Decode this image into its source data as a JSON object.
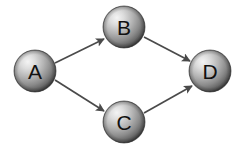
{
  "figure": {
    "title": "",
    "background_color": "#ffffff",
    "width": 241,
    "height": 148
  },
  "diagram": {
    "type": "directed-graph",
    "style": "3d-shaded-sphere-nodes",
    "node_colors": {
      "highlight": "#f2f2f2",
      "midtone": "#a8a8a8",
      "shadow": "#3a3a3a",
      "outline": "#555555",
      "label": "#111111"
    },
    "edge_color": "#4a4a4a",
    "nodes": [
      {
        "id": "A",
        "label": "A",
        "cx": 35,
        "cy": 71,
        "r": 21
      },
      {
        "id": "B",
        "label": "B",
        "cx": 124,
        "cy": 27,
        "r": 21
      },
      {
        "id": "C",
        "label": "C",
        "cx": 124,
        "cy": 122,
        "r": 21
      },
      {
        "id": "D",
        "label": "D",
        "cx": 210,
        "cy": 71,
        "r": 21
      }
    ],
    "edges": [
      {
        "id": "A-B",
        "from": "A",
        "to": "B",
        "label": "",
        "directed": true,
        "x1": 55,
        "y1": 63,
        "x2": 104,
        "y2": 39
      },
      {
        "id": "A-C",
        "from": "A",
        "to": "C",
        "label": "",
        "directed": true,
        "x1": 55,
        "y1": 80,
        "x2": 104,
        "y2": 111
      },
      {
        "id": "B-D",
        "from": "B",
        "to": "D",
        "label": "",
        "directed": true,
        "x1": 144,
        "y1": 37,
        "x2": 190,
        "y2": 61
      },
      {
        "id": "C-D",
        "from": "C",
        "to": "D",
        "label": "",
        "directed": true,
        "x1": 144,
        "y1": 113,
        "x2": 192,
        "y2": 86
      }
    ]
  }
}
